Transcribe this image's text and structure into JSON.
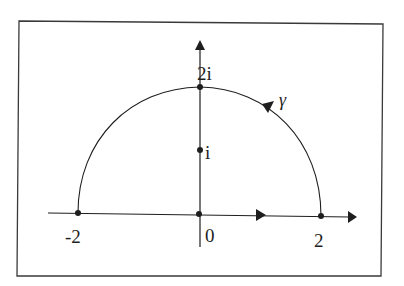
{
  "diagram": {
    "colors": {
      "background": "#ffffff",
      "ink": "#1e1e1e",
      "frame": "#3a3a3a"
    },
    "frame": {
      "x1": 19,
      "y1": 21,
      "x2": 382,
      "y2": 276
    },
    "axes": {
      "real": {
        "x_start": 48,
        "x_end": 356,
        "y": 214,
        "arrow_mid_x": 262,
        "direction": "right"
      },
      "imag": {
        "x": 200,
        "y_start": 247,
        "y_end": 40,
        "direction": "up"
      }
    },
    "contour": {
      "name": "γ",
      "center": [
        200,
        214
      ],
      "radius_x": 122,
      "radius_y": 127,
      "orientation": "counter-clockwise",
      "arrow_at": [
        268,
        110
      ]
    },
    "points": [
      {
        "id": "minus-two",
        "label": "-2",
        "x": 78,
        "y": 213,
        "label_x": 66,
        "label_y": 229
      },
      {
        "id": "origin",
        "label": "0",
        "x": 199,
        "y": 214,
        "label_x": 205,
        "label_y": 228
      },
      {
        "id": "two",
        "label": "2",
        "x": 321,
        "y": 216,
        "label_x": 314,
        "label_y": 233
      },
      {
        "id": "i",
        "label": "i",
        "x": 200,
        "y": 150,
        "label_x": 206,
        "label_y": 144
      },
      {
        "id": "two-i",
        "label": "2i",
        "x": 200,
        "y": 87,
        "label_x": 206,
        "label_y": 65
      }
    ],
    "labels": {
      "gamma": "γ",
      "minus_two": "-2",
      "zero": "0",
      "two": "2",
      "i": "i",
      "two_i": "2i"
    }
  }
}
